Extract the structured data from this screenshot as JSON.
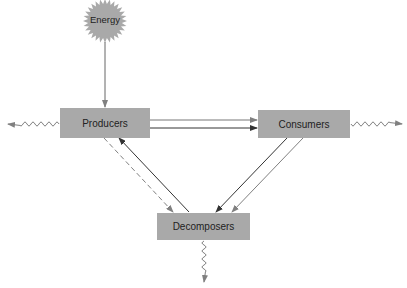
{
  "diagram": {
    "title": "",
    "nodes": {
      "energy": {
        "label": "Energy"
      },
      "producers": {
        "label": "Producers"
      },
      "consumers": {
        "label": "Consumers"
      },
      "decomposers": {
        "label": "Decomposers"
      }
    },
    "edges": [
      {
        "from": "energy",
        "to": "producers",
        "style": "solid"
      },
      {
        "from": "producers",
        "to": "consumers",
        "style": "solid",
        "count": 2
      },
      {
        "from": "consumers",
        "to": "decomposers",
        "style": "solid",
        "count": 2
      },
      {
        "from": "decomposers",
        "to": "producers",
        "style": "solid"
      },
      {
        "from": "producers",
        "to": "decomposers",
        "style": "dashed"
      },
      {
        "from": "producers",
        "to": "out-left",
        "style": "wavy",
        "meaning": "heat loss"
      },
      {
        "from": "consumers",
        "to": "out-right",
        "style": "wavy",
        "meaning": "heat loss"
      },
      {
        "from": "decomposers",
        "to": "out-down",
        "style": "wavy",
        "meaning": "heat loss"
      }
    ],
    "colors": {
      "box_fill": "#a9a9a9",
      "sun_fill": "#a9a9a9",
      "arrow_dark": "#333333",
      "arrow_light": "#808080"
    }
  }
}
